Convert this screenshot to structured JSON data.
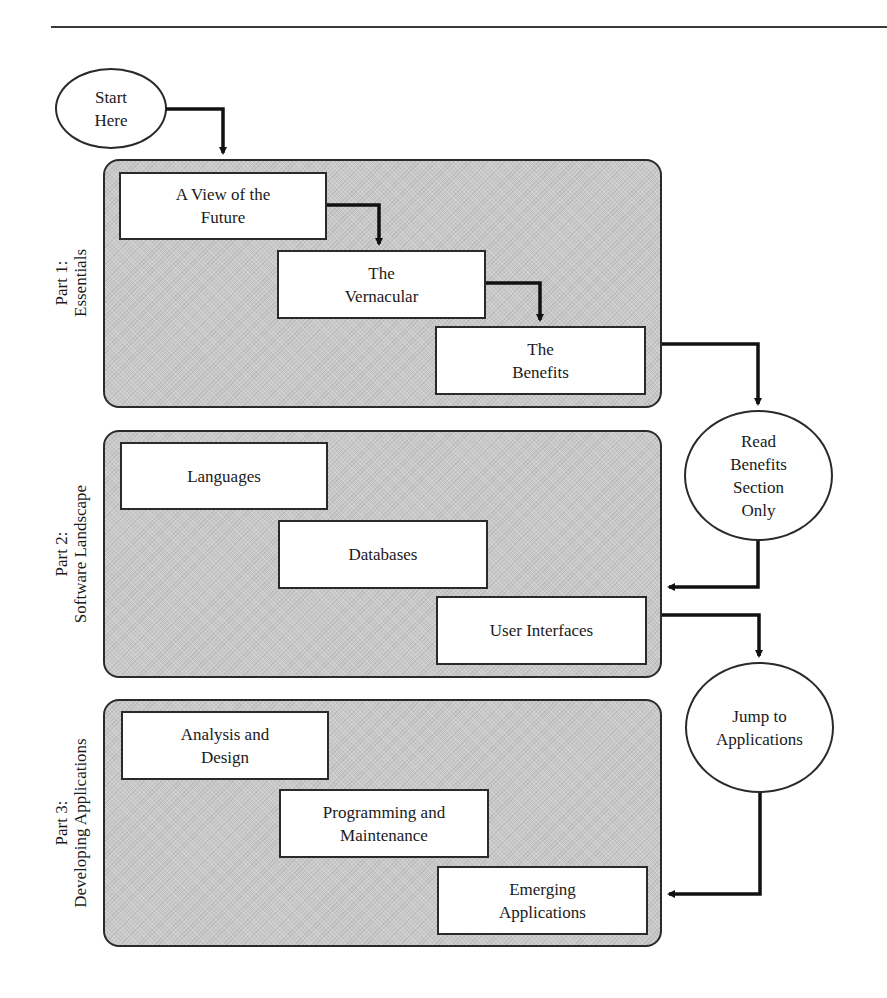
{
  "diagram": {
    "type": "flowchart",
    "start": {
      "label": "Start\nHere"
    },
    "parts": [
      {
        "label": "Part 1:\nEssentials",
        "chapters": [
          {
            "label": "A View of the\nFuture"
          },
          {
            "label": "The\nVernacular"
          },
          {
            "label": "The\nBenefits"
          }
        ]
      },
      {
        "label": "Part 2:\nSoftware Landscape",
        "chapters": [
          {
            "label": "Languages"
          },
          {
            "label": "Databases"
          },
          {
            "label": "User Interfaces"
          }
        ]
      },
      {
        "label": "Part 3:\nDeveloping Applications",
        "chapters": [
          {
            "label": "Analysis and\nDesign"
          },
          {
            "label": "Programming and\nMaintenance"
          },
          {
            "label": "Emerging\nApplications"
          }
        ]
      }
    ],
    "shortcuts": [
      {
        "label": "Read\nBenefits\nSection\nOnly",
        "from": "Part 1: Essentials",
        "to": "Part 2: Software Landscape"
      },
      {
        "label": "Jump to\nApplications",
        "from": "Part 2: Software Landscape",
        "to": "Part 3: Developing Applications"
      }
    ],
    "flows": [
      {
        "from": "Start Here",
        "to": "Part 1: Essentials"
      },
      {
        "from": "A View of the Future",
        "to": "The Vernacular"
      },
      {
        "from": "The Vernacular",
        "to": "The Benefits"
      },
      {
        "from": "Part 1: Essentials",
        "to": "Read Benefits Section Only"
      },
      {
        "from": "Read Benefits Section Only",
        "to": "Part 2: Software Landscape"
      },
      {
        "from": "Part 2: Software Landscape",
        "to": "Jump to Applications"
      },
      {
        "from": "Jump to Applications",
        "to": "Part 3: Developing Applications"
      }
    ],
    "colors": {
      "panel_fill": "#c9c9c9",
      "stroke": "#2a2a2a",
      "box_fill": "#ffffff"
    }
  }
}
